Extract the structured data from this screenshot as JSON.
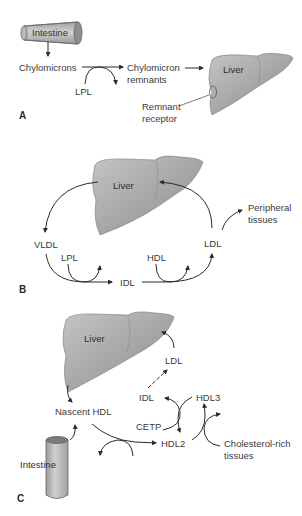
{
  "figure": {
    "panels": [
      {
        "id": "A",
        "label": "A",
        "organs": {
          "intestine": "Intestine",
          "liver": "Liver"
        },
        "nodes": {
          "chylomicrons": "Chylomicrons",
          "lpl": "LPL",
          "chylomicron_remnants_line1": "Chylomicron",
          "chylomicron_remnants_line2": "remnants",
          "remnant_receptor_line1": "Remnant",
          "remnant_receptor_line2": "receptor"
        }
      },
      {
        "id": "B",
        "label": "B",
        "organs": {
          "liver": "Liver"
        },
        "nodes": {
          "vldl": "VLDL",
          "lpl": "LPL",
          "idl": "IDL",
          "hdl": "HDL",
          "ldl": "LDL",
          "peripheral_line1": "Peripheral",
          "peripheral_line2": "tissues"
        }
      },
      {
        "id": "C",
        "label": "C",
        "organs": {
          "liver": "Liver",
          "intestine": "Intestine"
        },
        "nodes": {
          "ldl": "LDL",
          "idl": "IDL",
          "hdl3": "HDL3",
          "cetp": "CETP",
          "nascent_hdl": "Nascent HDL",
          "hdl2": "HDL2",
          "chol_rich_line1": "Cholesterol-rich",
          "chol_rich_line2": "tissues"
        }
      }
    ],
    "colors": {
      "organ_fill": "#a9a9a9",
      "organ_stroke": "#7a7a7a",
      "arrow": "#2b2b2b",
      "text": "#3a3a3a"
    }
  }
}
